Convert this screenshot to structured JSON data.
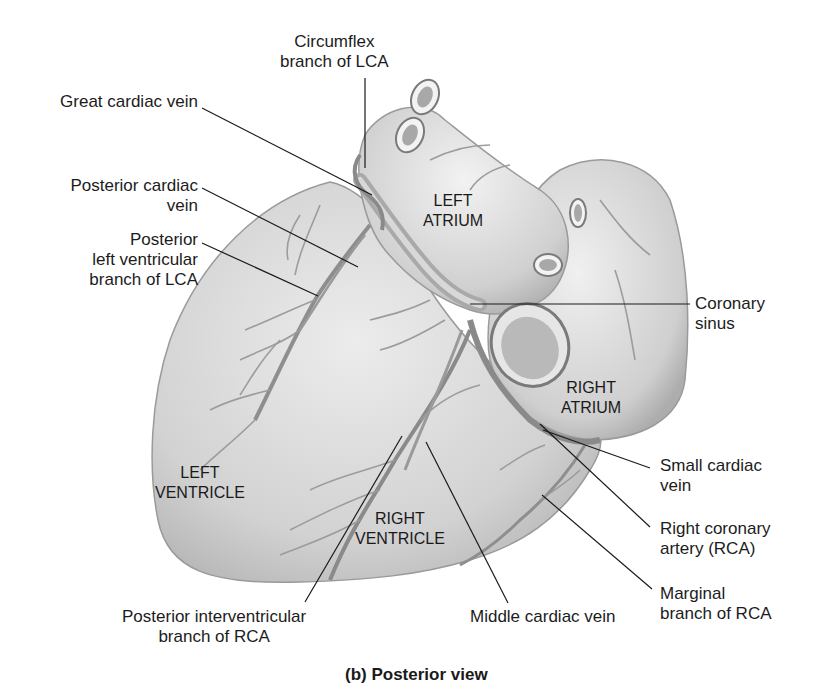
{
  "figure": {
    "caption": "(b) Posterior view",
    "view": "posterior",
    "colors": {
      "background": "#ffffff",
      "heart_fill": "#d9d9d9",
      "heart_shadow": "#b5b5b5",
      "vessel": "#8e8e8e",
      "vessel_dark": "#6f6f6f",
      "leader_line": "#1a1a1a",
      "text": "#1c1c1c"
    }
  },
  "regions": {
    "left_atrium": [
      "LEFT",
      "ATRIUM"
    ],
    "right_atrium": [
      "RIGHT",
      "ATRIUM"
    ],
    "left_ventricle": [
      "LEFT",
      "VENTRICLE"
    ],
    "right_ventricle": [
      "RIGHT",
      "VENTRICLE"
    ]
  },
  "labels": {
    "circumflex": [
      "Circumflex",
      "branch of LCA"
    ],
    "great_cardiac_vein": [
      "Great cardiac vein"
    ],
    "posterior_cardiac_vein": [
      "Posterior cardiac",
      "vein"
    ],
    "posterior_lv_branch": [
      "Posterior",
      "left ventricular",
      "branch of LCA"
    ],
    "coronary_sinus": [
      "Coronary",
      "sinus"
    ],
    "small_cardiac_vein": [
      "Small cardiac",
      "vein"
    ],
    "rca": [
      "Right coronary",
      "artery (RCA)"
    ],
    "marginal_branch": [
      "Marginal",
      "branch of RCA"
    ],
    "middle_cardiac_vein": [
      "Middle cardiac vein"
    ],
    "posterior_interventricular": [
      "Posterior interventricular",
      "branch of RCA"
    ]
  }
}
